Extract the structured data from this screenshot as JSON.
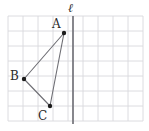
{
  "figure": {
    "width": 149,
    "height": 131,
    "background_color": "#ffffff"
  },
  "grid": {
    "color": "#d8d8dd",
    "cell_size": 15,
    "x_start": 8,
    "y_start": 16,
    "columns": 9,
    "rows": 7,
    "visible": true
  },
  "line": {
    "name": "line-l",
    "label": "ℓ",
    "color": "#7a7a80",
    "x": 73,
    "y_top": 16,
    "y_bottom": 124,
    "label_x": 68,
    "label_y": 2
  },
  "triangle": {
    "name": "triangle-ABC",
    "stroke_color": "#6e6e74",
    "fill": "none",
    "vertices": [
      {
        "label": "A",
        "x": 64,
        "y": 33,
        "label_x": 52,
        "label_y": 18
      },
      {
        "label": "B",
        "x": 24,
        "y": 79,
        "label_x": 10,
        "label_y": 70
      },
      {
        "label": "C",
        "x": 50,
        "y": 106,
        "label_x": 38,
        "label_y": 110
      }
    ],
    "vertex_dot_color": "#1c1c1c",
    "vertex_dot_radius": 2.2,
    "edges": [
      "A-B",
      "B-C",
      "C-A"
    ]
  },
  "chart_data": {
    "type": "scatter",
    "xlabel": "",
    "ylabel": "",
    "points": [
      {
        "name": "A",
        "x": 64,
        "y": 33
      },
      {
        "name": "B",
        "x": 24,
        "y": 79
      },
      {
        "name": "C",
        "x": 50,
        "y": 106
      }
    ],
    "annotations": [
      "ℓ"
    ]
  }
}
